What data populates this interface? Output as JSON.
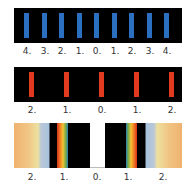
{
  "figure_a": {
    "description": "Monochromatic (blue) diffraction pattern — grating",
    "bar_color": "#2a6fc0",
    "background": "#000000",
    "orders": [
      "4.",
      "3.",
      "2.",
      "1.",
      "0.",
      "1.",
      "2.",
      "3.",
      "4."
    ]
  },
  "figure_b": {
    "description": "Monochromatic (red) diffraction pattern — grating",
    "bar_color": "#e23a1e",
    "background": "#000000",
    "orders": [
      "2.",
      "1.",
      "0.",
      "1.",
      "2."
    ]
  },
  "figure_c": {
    "description": "White light spectra — diffraction orders",
    "orders": [
      "2.",
      "1.",
      "0.",
      "1.",
      "2."
    ],
    "left_gradient": [
      "#f0b879",
      "#f3d48a",
      "#ecdf9e",
      "#b8c8d8",
      "#a9c3dd"
    ],
    "spectrum_first_order": [
      "#d6321c",
      "#ef7a22",
      "#f3c234",
      "#6aa84a",
      "#2f7fbf"
    ]
  }
}
